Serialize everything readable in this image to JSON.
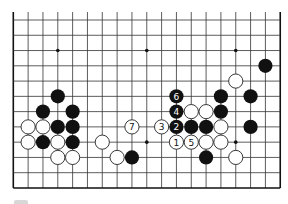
{
  "diagram": {
    "type": "go-board-partial",
    "columns": 19,
    "rows_visible": 12,
    "open_edge": "top",
    "closed_edges": [
      "left",
      "right",
      "bottom"
    ],
    "star_points": [
      [
        3,
        2
      ],
      [
        9,
        2
      ],
      [
        15,
        2
      ],
      [
        9,
        8
      ],
      [
        15,
        8
      ]
    ],
    "stones": [
      {
        "color": "black",
        "col": 3,
        "row": 5
      },
      {
        "color": "black",
        "col": 2,
        "row": 6
      },
      {
        "color": "black",
        "col": 4,
        "row": 6
      },
      {
        "color": "white",
        "col": 1,
        "row": 7
      },
      {
        "color": "white",
        "col": 2,
        "row": 7
      },
      {
        "color": "black",
        "col": 3,
        "row": 7
      },
      {
        "color": "black",
        "col": 4,
        "row": 7
      },
      {
        "color": "white",
        "col": 1,
        "row": 8
      },
      {
        "color": "black",
        "col": 2,
        "row": 8
      },
      {
        "color": "white",
        "col": 3,
        "row": 8
      },
      {
        "color": "black",
        "col": 4,
        "row": 8
      },
      {
        "color": "white",
        "col": 3,
        "row": 9
      },
      {
        "color": "white",
        "col": 4,
        "row": 9
      },
      {
        "color": "white",
        "col": 6,
        "row": 8
      },
      {
        "color": "white",
        "col": 7,
        "row": 9
      },
      {
        "color": "black",
        "col": 8,
        "row": 9
      },
      {
        "color": "white",
        "col": 8,
        "row": 7,
        "label": "7"
      },
      {
        "color": "white",
        "col": 10,
        "row": 7,
        "label": "3"
      },
      {
        "color": "black",
        "col": 11,
        "row": 5,
        "label": "6"
      },
      {
        "color": "black",
        "col": 11,
        "row": 6,
        "label": "4"
      },
      {
        "color": "black",
        "col": 11,
        "row": 7,
        "label": "2"
      },
      {
        "color": "white",
        "col": 11,
        "row": 8,
        "label": "1"
      },
      {
        "color": "white",
        "col": 12,
        "row": 8,
        "label": "5"
      },
      {
        "color": "white",
        "col": 12,
        "row": 6
      },
      {
        "color": "white",
        "col": 13,
        "row": 6
      },
      {
        "color": "black",
        "col": 12,
        "row": 7
      },
      {
        "color": "black",
        "col": 13,
        "row": 7
      },
      {
        "color": "white",
        "col": 13,
        "row": 8
      },
      {
        "color": "black",
        "col": 13,
        "row": 9
      },
      {
        "color": "black",
        "col": 14,
        "row": 5
      },
      {
        "color": "black",
        "col": 14,
        "row": 6
      },
      {
        "color": "white",
        "col": 14,
        "row": 7
      },
      {
        "color": "white",
        "col": 14,
        "row": 8
      },
      {
        "color": "white",
        "col": 15,
        "row": 4
      },
      {
        "color": "white",
        "col": 15,
        "row": 9
      },
      {
        "color": "black",
        "col": 16,
        "row": 5
      },
      {
        "color": "black",
        "col": 16,
        "row": 7
      },
      {
        "color": "black",
        "col": 17,
        "row": 3
      }
    ]
  },
  "colors": {
    "line": "#333333",
    "black_stone": "#111111",
    "white_stone": "#ffffff",
    "background": "#ffffff"
  }
}
